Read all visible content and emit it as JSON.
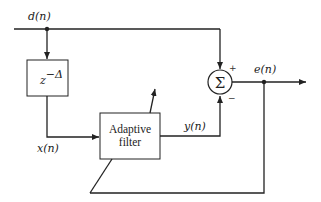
{
  "diagram": {
    "signals": {
      "input": "d(n)",
      "delayed": "x(n)",
      "filter_output": "y(n)",
      "error": "e(n)"
    },
    "blocks": {
      "delay": {
        "base": "z",
        "exponent": "−Δ"
      },
      "filter": {
        "line1": "Adaptive",
        "line2": "filter"
      },
      "summer": {
        "symbol": "Σ",
        "plus": "+",
        "minus": "−"
      }
    },
    "colors": {
      "stroke": "#222222",
      "background": "#ffffff"
    }
  }
}
